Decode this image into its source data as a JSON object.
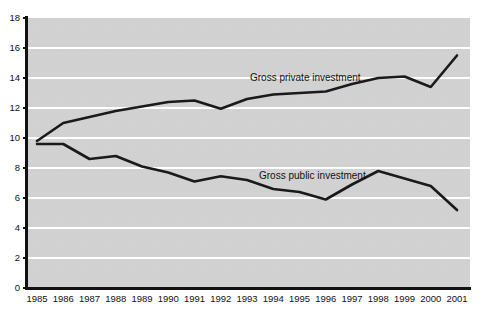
{
  "chart_data": {
    "type": "line",
    "title": "",
    "xlabel": "",
    "ylabel": "",
    "grid": "horizontal",
    "legend_position": "inline-annotations",
    "ylim": [
      0,
      18
    ],
    "ytick_step": 2,
    "yticks": [
      "0",
      "2",
      "4",
      "6",
      "8",
      "10",
      "12",
      "14",
      "16",
      "18"
    ],
    "categories": [
      "1985",
      "1986",
      "1987",
      "1988",
      "1989",
      "1990",
      "1991",
      "1992",
      "1993",
      "1994",
      "1995",
      "1996",
      "1997",
      "1998",
      "1999",
      "2000",
      "2001"
    ],
    "series": [
      {
        "name": "Gross private investment",
        "color": "#1a1a1a",
        "values": [
          9.8,
          11.0,
          11.4,
          11.8,
          12.1,
          12.4,
          12.5,
          11.95,
          12.6,
          12.9,
          13.0,
          13.1,
          13.6,
          14.0,
          14.1,
          13.4,
          15.5
        ]
      },
      {
        "name": "Gross public investment",
        "color": "#1a1a1a",
        "values": [
          9.6,
          9.6,
          8.6,
          8.8,
          8.1,
          7.7,
          7.1,
          7.45,
          7.2,
          6.6,
          6.4,
          5.9,
          6.9,
          7.8,
          7.3,
          6.8,
          5.2
        ]
      }
    ],
    "annotations": [
      {
        "text": "Gross private investment",
        "x_px": 250,
        "y_px": 72
      },
      {
        "text": "Gross public investment",
        "x_px": 259,
        "y_px": 170
      }
    ],
    "colors": {
      "plot_background": "#d4d4d4",
      "gridline": "#ffffff",
      "axis": "#111111",
      "line": "#1a1a1a",
      "page_background": "#ffffff",
      "text": "#111111"
    },
    "geometry": {
      "plot_left_px": 28,
      "plot_right_px": 470,
      "plot_top_px": 18,
      "plot_bottom_px": 288,
      "x_first_px": 37,
      "x_last_px": 457
    }
  }
}
